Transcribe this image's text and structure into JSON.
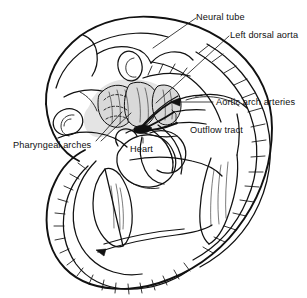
{
  "figure": {
    "kind": "embryo-cardiovascular-diagram",
    "background_color": "#ffffff",
    "ink_color": "#111111",
    "shade_color": "#d9d9d9",
    "width": 307,
    "height": 298
  },
  "labels": {
    "neural_tube": "Neural tube",
    "left_dorsal_aorta": "Left dorsal aorta",
    "aortic_arch_arteries": "Aortic arch arteries",
    "outflow_tract": "Outflow tract",
    "pharyngeal_arches": "Pharyngeal arches",
    "heart": "Heart"
  }
}
